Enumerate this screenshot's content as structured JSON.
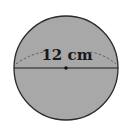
{
  "diagram": {
    "shape": "circle",
    "fill_color": "#a8a8a8",
    "stroke_color": "#2a2a2a",
    "measurement_label": "12 cm",
    "measurement_type": "diameter",
    "center_marked": true
  }
}
